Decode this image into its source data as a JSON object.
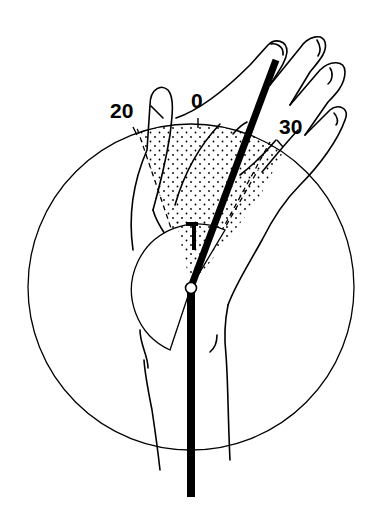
{
  "figure": {
    "type": "wrist-range-of-motion-diagram",
    "labels": {
      "left": "20",
      "center": "0",
      "right": "30"
    },
    "colors": {
      "ink": "#000000",
      "background": "#ffffff"
    }
  }
}
